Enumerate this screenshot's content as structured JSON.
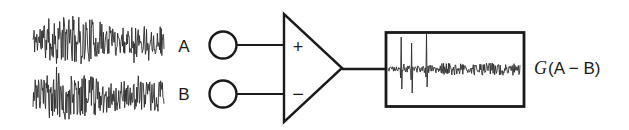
{
  "colors": {
    "ink": "#1a1a1a",
    "wave": "#2b2b2b",
    "background": "#ffffff"
  },
  "labels": {
    "input_a": "A",
    "input_b": "B",
    "opamp_plus": "+",
    "opamp_minus": "−",
    "output_gain": "G",
    "output_expr": "(A − B)"
  },
  "waveforms": {
    "input_a": {
      "seed": 11,
      "points": 240,
      "x": 33,
      "width": 131,
      "baseline": 40,
      "amp": 24,
      "spike_prob": 0.05,
      "spike_gain": 1.7,
      "clamp": 29,
      "envelope": [
        [
          0,
          0.55
        ],
        [
          0.1,
          0.9
        ],
        [
          0.18,
          1.0
        ],
        [
          0.38,
          1.0
        ],
        [
          0.55,
          0.7
        ],
        [
          0.8,
          0.6
        ],
        [
          1,
          0.65
        ]
      ]
    },
    "input_b": {
      "seed": 23,
      "points": 240,
      "x": 33,
      "width": 131,
      "baseline": 96,
      "amp": 24,
      "spike_prob": 0.05,
      "spike_gain": 1.7,
      "clamp": 29,
      "envelope": [
        [
          0,
          0.55
        ],
        [
          0.1,
          0.9
        ],
        [
          0.18,
          1.0
        ],
        [
          0.38,
          1.0
        ],
        [
          0.55,
          0.7
        ],
        [
          0.8,
          0.6
        ],
        [
          1,
          0.65
        ]
      ]
    },
    "output": {
      "seed": 5,
      "points": 240,
      "x": 388,
      "width": 132,
      "baseline": 69,
      "amp": 13,
      "spike_prob": 0.04,
      "spike_gain": 1.5,
      "clamp": 40,
      "envelope": [
        [
          0,
          0.2
        ],
        [
          0.08,
          0.25
        ],
        [
          0.3,
          0.3
        ],
        [
          0.42,
          0.45
        ],
        [
          1,
          0.5
        ]
      ],
      "spikes": [
        {
          "f": 0.1,
          "up": 32,
          "down": 20
        },
        {
          "f": 0.18,
          "up": 26,
          "down": 24
        },
        {
          "f": 0.29,
          "up": 35,
          "down": 18
        }
      ]
    }
  }
}
